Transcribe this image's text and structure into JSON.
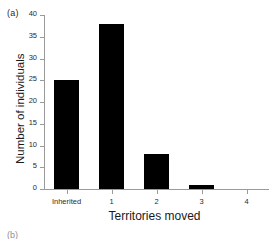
{
  "figure": {
    "panel_label": "(a)",
    "next_panel_label": "(b)"
  },
  "chart_data": {
    "type": "bar",
    "title": "",
    "categories": [
      "Inherited",
      "1",
      "2",
      "3",
      "4"
    ],
    "values": [
      25,
      38,
      8,
      1,
      0
    ],
    "xlabel": "Territories moved",
    "ylabel": "Number of individuals",
    "ylim": [
      0,
      40
    ],
    "yticks": [
      0,
      5,
      10,
      15,
      20,
      25,
      30,
      35,
      40
    ],
    "ytick_labels": [
      "0",
      "5",
      "10",
      "15",
      "20",
      "25",
      "30",
      "35",
      "40"
    ],
    "xtick_labels": [
      "Inherited",
      "1",
      "2",
      "3",
      "4"
    ],
    "grid": false,
    "legend": false,
    "bar_color": "#000000",
    "axis_color": "#9a9a9a"
  }
}
